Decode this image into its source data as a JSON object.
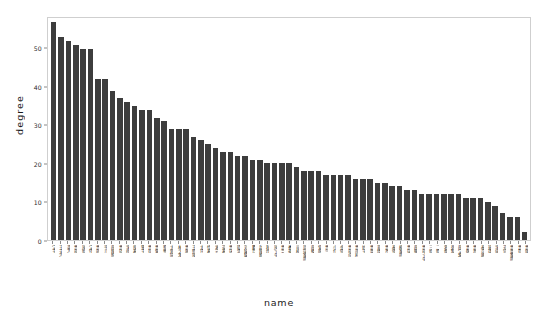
{
  "chart_data": {
    "type": "bar",
    "title": "",
    "xlabel": "name",
    "ylabel": "degree",
    "ylim": [
      0,
      58
    ],
    "yticks": [
      0,
      10,
      20,
      30,
      40,
      50
    ],
    "grid": false,
    "legend": null,
    "bar_color": "#3d3d3d",
    "categories": [
      "宝玉",
      "王夫人",
      "袭人",
      "贾母",
      "凤姐",
      "宝钗",
      "贾政",
      "平儿",
      "薛姨妈",
      "贾琏",
      "李纨",
      "探春",
      "黛玉",
      "贾珍",
      "贾蓉",
      "鸳鸯",
      "大观园",
      "林之孝",
      "贾赦",
      "王熙凤",
      "尤氏",
      "惜春",
      "湘云",
      "迎春",
      "贾环",
      "晴雯",
      "刘姥姥",
      "麝月",
      "赵姨娘",
      "秋纹",
      "凤丫头",
      "贾芸",
      "香菱",
      "司棋",
      "周瑞家的",
      "薛蟠",
      "紫鹃",
      "贾兰",
      "小红",
      "金钏",
      "贾母房",
      "贾雨村",
      "妙玉",
      "贾蔷",
      "翠缕",
      "贾芹",
      "秦钟",
      "柳家的",
      "贾瑞",
      "薛蝌",
      "贾母丫头",
      "三姐",
      "二姐",
      "茗烟",
      "碧痕",
      "薛宝琴",
      "贾敬",
      "贾菖",
      "秦可卿",
      "玻璃",
      "李婶",
      "芳官",
      "贾蔷家的",
      "贾琮",
      "贾菌"
    ],
    "values": [
      57,
      53,
      52,
      51,
      50,
      50,
      42,
      42,
      39,
      37,
      36,
      35,
      34,
      34,
      32,
      31,
      29,
      29,
      29,
      27,
      26,
      25,
      24,
      23,
      23,
      22,
      22,
      21,
      21,
      20,
      20,
      20,
      20,
      19,
      18,
      18,
      18,
      17,
      17,
      17,
      17,
      16,
      16,
      16,
      15,
      15,
      14,
      14,
      13,
      13,
      12,
      12,
      12,
      12,
      12,
      12,
      11,
      11,
      11,
      10,
      9,
      7,
      6,
      6,
      2
    ]
  },
  "axes": {
    "y_tick_labels": [
      "0",
      "10",
      "20",
      "30",
      "40",
      "50"
    ],
    "y_axis_title": "degree",
    "x_axis_title": "name"
  }
}
